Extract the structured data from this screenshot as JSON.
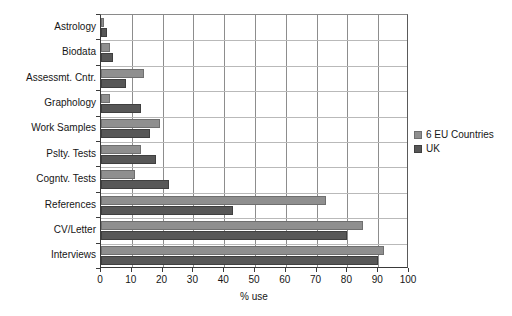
{
  "chart_data": {
    "type": "bar",
    "orientation": "horizontal",
    "title": "",
    "xlabel": "% use",
    "ylabel": "",
    "xlim": [
      0,
      100
    ],
    "xticks": [
      0,
      10,
      20,
      30,
      40,
      50,
      60,
      70,
      80,
      90,
      100
    ],
    "grid": "both",
    "legend_position": "right",
    "categories": [
      "Astrology",
      "Biodata",
      "Assessmt. Cntr.",
      "Graphology",
      "Work Samples",
      "Pslty. Tests",
      "Cogntv. Tests",
      "References",
      "CV/Letter",
      "Interviews"
    ],
    "series": [
      {
        "name": "6 EU Countries",
        "color": "#8f8f8f",
        "values": [
          1,
          3,
          14,
          3,
          19,
          13,
          11,
          73,
          85,
          92
        ]
      },
      {
        "name": "UK",
        "color": "#575757",
        "values": [
          2,
          4,
          8,
          13,
          16,
          18,
          22,
          43,
          80,
          90
        ]
      }
    ]
  },
  "legend": {
    "items": [
      {
        "label": "6 EU Countries",
        "swatch": "eu"
      },
      {
        "label": "UK",
        "swatch": "uk"
      }
    ]
  }
}
